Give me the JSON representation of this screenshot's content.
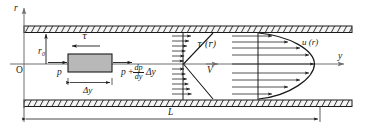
{
  "figure": {
    "type": "technical-diagram"
  },
  "axes": {
    "vertical_label": "r",
    "horizontal_label": "y",
    "origin_label": "O"
  },
  "labels": {
    "radius": "r",
    "radius_sub": "0",
    "shear_arrow": "τ",
    "pressure_left": "p",
    "pressure_right_base": "p",
    "pressure_right_plus": "+",
    "pressure_right_num": "dp",
    "pressure_right_den": "dy",
    "pressure_right_delta": "Δy",
    "element_width": "Δy",
    "shear_profile": "τ (r)",
    "velocity_profile": "u (r)",
    "mean_velocity": "V",
    "length": "L"
  },
  "colors": {
    "line": "#1a1a1a",
    "wall_fill": "#f2f2f2",
    "element_fill": "#b8b8b8",
    "element_stroke": "#1a1a1a",
    "axis": "#6e6e6e",
    "background": "#ffffff"
  },
  "geometry": {
    "top_wall_y": 26,
    "bottom_wall_y": 100,
    "centerline_y": 64,
    "pipe_left_x": 24,
    "pipe_right_x": 352,
    "element_left_x": 68,
    "element_right_x": 112,
    "element_top_y": 54,
    "element_bottom_y": 72,
    "tau_station_x": 183,
    "u_station_x": 258,
    "length_dim_y": 119,
    "length_dim_left_x": 24,
    "length_dim_right_x": 320
  }
}
